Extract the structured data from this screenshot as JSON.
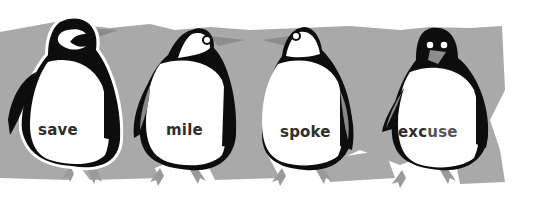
{
  "colors": {
    "background": "#ffffff",
    "ice": "#a9a9a9",
    "penguin_black": "#0d0d0d",
    "penguin_white": "#ffffff",
    "beak": "#8c8c8c",
    "feet": "#9a9a9a",
    "text_dark": "#2e2e2e",
    "text_light": "#555555"
  },
  "penguins": [
    {
      "word": "save",
      "parts": [
        {
          "text": "s",
          "tone": "dark"
        },
        {
          "text": "ave",
          "tone": "dark"
        }
      ]
    },
    {
      "word": "mile",
      "parts": [
        {
          "text": "mile",
          "tone": "dark"
        }
      ]
    },
    {
      "word": "spoke",
      "parts": [
        {
          "text": "sp",
          "tone": "dark"
        },
        {
          "text": "oke",
          "tone": "dark"
        }
      ]
    },
    {
      "word": "excuse",
      "parts": [
        {
          "text": "exc",
          "tone": "dark"
        },
        {
          "text": "use",
          "tone": "light"
        }
      ]
    }
  ]
}
